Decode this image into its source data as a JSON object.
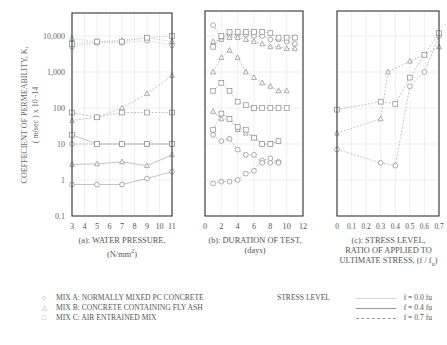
{
  "figure": {
    "ylabel_line1": "COEFFECIENT OF PERMEABILITY, K,",
    "ylabel_line2": "( m/sec ) x 10 -14",
    "yticks": [
      "10,000",
      "1,000",
      "100",
      "10",
      "1",
      "0.1"
    ],
    "captions": {
      "a_line1": "(a): WATER PRESSURE,",
      "a_line2": "(N/mm",
      "a_sup": "2",
      "a_tail": ")",
      "b_line1": "(b): DURATION OF TEST,",
      "b_line2": "(days)",
      "c_line1": "(c): STRESS LEVEL,",
      "c_line2": "RATIO OF APPLIED TO",
      "c_line3": "ULTIMATE STRESS, (f / f",
      "c_sub": "u",
      "c_tail": ")"
    },
    "legend": {
      "mix_a": "MIX A: NORMALLY MIXED PC CONCRETE",
      "mix_b": "MIX B: CONCRETE CONTAINING FLY ASH",
      "mix_c": "MIX C: AIR ENTRAINED MIX",
      "marker_a": "○",
      "marker_b": "△",
      "marker_c": "□",
      "stress_title": "STRESS LEVEL",
      "stress_0": "f = 0.0 fu",
      "stress_04": "f = 0.4 fu",
      "stress_07": "f = 0.7 fu"
    },
    "colors": {
      "frame": "#333333",
      "grid": "#e4e4e4",
      "marker": "#8a8a8a",
      "line": "#aaaaaa",
      "text": "#555555"
    }
  },
  "chart_data": [
    {
      "type": "scatter",
      "title": "(a): WATER PRESSURE, (N/mm2)",
      "xlabel": "WATER PRESSURE (N/mm2)",
      "ylabel": "COEFFECIENT OF PERMEABILITY, K, (m/sec) x 10-14",
      "yscale": "log",
      "xlim": [
        3,
        11
      ],
      "ylim": [
        0.1,
        20000
      ],
      "xticks": [
        3,
        4,
        5,
        6,
        7,
        8,
        9,
        10,
        11
      ],
      "yticks": [
        0.1,
        1,
        10,
        100,
        1000,
        10000
      ],
      "grid": true,
      "series": [
        {
          "name": "Mix A f=0.0fu",
          "marker": "circle",
          "line": "solid",
          "x": [
            3,
            5,
            7,
            9,
            11
          ],
          "y": [
            0.75,
            0.75,
            0.75,
            1.1,
            1.7
          ]
        },
        {
          "name": "Mix A f=0.4fu",
          "marker": "circle",
          "line": "dashed",
          "x": [
            3,
            5,
            7,
            9,
            11
          ],
          "y": [
            10,
            10,
            10,
            10,
            10
          ]
        },
        {
          "name": "Mix A f=0.7fu",
          "marker": "circle",
          "line": "dotted",
          "x": [
            3,
            5,
            7,
            9,
            11
          ],
          "y": [
            5000,
            6500,
            6500,
            7500,
            5500
          ]
        },
        {
          "name": "Mix B f=0.0fu",
          "marker": "triangle",
          "line": "solid",
          "x": [
            3,
            5,
            7,
            9,
            11
          ],
          "y": [
            2.7,
            2.8,
            3.2,
            2.5,
            5
          ]
        },
        {
          "name": "Mix B f=0.4fu",
          "marker": "triangle",
          "line": "dashed",
          "x": [
            3,
            5,
            7,
            9,
            11
          ],
          "y": [
            45,
            55,
            100,
            250,
            800
          ]
        },
        {
          "name": "Mix B f=0.7fu",
          "marker": "triangle",
          "line": "dotted",
          "x": [
            3,
            5,
            7,
            9,
            11
          ],
          "y": [
            8500,
            7000,
            7500,
            9000,
            7000
          ]
        },
        {
          "name": "Mix C f=0.0fu",
          "marker": "square",
          "line": "solid",
          "x": [
            3,
            5,
            7,
            9,
            11
          ],
          "y": [
            18,
            10,
            10,
            10,
            10
          ]
        },
        {
          "name": "Mix C f=0.4fu",
          "marker": "square",
          "line": "dashed",
          "x": [
            3,
            5,
            7,
            9,
            11
          ],
          "y": [
            75,
            55,
            75,
            75,
            75
          ]
        },
        {
          "name": "Mix C f=0.7fu",
          "marker": "square",
          "line": "dotted",
          "x": [
            3,
            5,
            7,
            9,
            11
          ],
          "y": [
            6000,
            7000,
            7000,
            9000,
            10000
          ]
        }
      ]
    },
    {
      "type": "scatter",
      "title": "(b): DURATION OF TEST, (days)",
      "xlabel": "DURATION OF TEST (days)",
      "yscale": "log",
      "xlim": [
        0,
        12
      ],
      "ylim": [
        0.1,
        20000
      ],
      "xticks": [
        0,
        2,
        4,
        6,
        8,
        10,
        12
      ],
      "grid": true,
      "series": [
        {
          "name": "Mix A f=0.0fu",
          "marker": "circle",
          "x": [
            1,
            2,
            3,
            4,
            5,
            6,
            7,
            8,
            9
          ],
          "y": [
            0.8,
            0.9,
            0.9,
            1.0,
            1.5,
            1.8,
            3.5,
            4,
            3.2
          ]
        },
        {
          "name": "Mix A f=0.4fu",
          "marker": "circle",
          "x": [
            1,
            2,
            3,
            4,
            5,
            6,
            7,
            8,
            9
          ],
          "y": [
            18,
            12,
            14,
            7,
            5,
            5,
            3,
            3,
            3
          ]
        },
        {
          "name": "Mix A f=0.7fu",
          "marker": "circle",
          "x": [
            1,
            2,
            3,
            4,
            5,
            6,
            7,
            8,
            9,
            10,
            11
          ],
          "y": [
            20000,
            9000,
            11000,
            11000,
            11000,
            10000,
            10000,
            8000,
            8000,
            7000,
            6000
          ]
        },
        {
          "name": "Mix B f=0.0fu",
          "marker": "triangle",
          "x": [
            1,
            2,
            3,
            4,
            5,
            6,
            7,
            8,
            9
          ],
          "y": [
            80,
            50,
            50,
            25,
            20,
            15,
            10,
            10,
            12
          ]
        },
        {
          "name": "Mix B f=0.4fu",
          "marker": "triangle",
          "x": [
            1,
            2,
            3,
            4,
            5,
            6,
            7,
            8,
            9,
            10
          ],
          "y": [
            1000,
            2500,
            4000,
            2500,
            1000,
            700,
            500,
            400,
            300,
            300
          ]
        },
        {
          "name": "Mix B f=0.7fu",
          "marker": "triangle",
          "x": [
            1,
            2,
            3,
            4,
            5,
            6,
            7,
            8,
            9,
            10,
            11
          ],
          "y": [
            7000,
            8000,
            9000,
            9000,
            8000,
            7000,
            6000,
            5000,
            5000,
            4500,
            4500
          ]
        },
        {
          "name": "Mix C f=0.0fu",
          "marker": "square",
          "x": [
            1,
            2,
            3,
            4,
            5,
            6,
            7,
            8,
            9
          ],
          "y": [
            25,
            70,
            50,
            30,
            25,
            15,
            10,
            10,
            12
          ]
        },
        {
          "name": "Mix C f=0.4fu",
          "marker": "square",
          "x": [
            1,
            2,
            3,
            4,
            5,
            6,
            7,
            8,
            9,
            10
          ],
          "y": [
            300,
            500,
            300,
            150,
            120,
            100,
            100,
            100,
            100,
            100
          ]
        },
        {
          "name": "Mix C f=0.7fu",
          "marker": "square",
          "x": [
            1,
            2,
            3,
            4,
            5,
            6,
            7,
            8,
            9,
            10,
            11
          ],
          "y": [
            5000,
            10000,
            13000,
            13000,
            13000,
            13000,
            13000,
            12000,
            9000,
            9000,
            9000
          ]
        }
      ]
    },
    {
      "type": "scatter",
      "title": "(c): STRESS LEVEL, RATIO OF APPLIED TO ULTIMATE STRESS, (f / fu)",
      "xlabel": "STRESS LEVEL (f / fu)",
      "yscale": "log",
      "xlim": [
        0,
        0.7
      ],
      "ylim": [
        0.1,
        20000
      ],
      "xticks": [
        0,
        0.1,
        0.2,
        0.3,
        0.4,
        0.5,
        0.6,
        0.7
      ],
      "grid": true,
      "series": [
        {
          "name": "Mix A",
          "marker": "circle",
          "x": [
            0,
            0.3,
            0.4,
            0.5,
            0.6,
            0.7
          ],
          "y": [
            7,
            3,
            2.5,
            400,
            1000,
            10000
          ]
        },
        {
          "name": "Mix B",
          "marker": "triangle",
          "x": [
            0,
            0.3,
            0.35,
            0.5,
            0.6,
            0.7
          ],
          "y": [
            20,
            50,
            1000,
            2000,
            3000,
            5000
          ]
        },
        {
          "name": "Mix C",
          "marker": "square",
          "x": [
            0,
            0.3,
            0.4,
            0.5,
            0.6,
            0.7
          ],
          "y": [
            90,
            150,
            130,
            700,
            3000,
            12000
          ]
        }
      ]
    }
  ]
}
